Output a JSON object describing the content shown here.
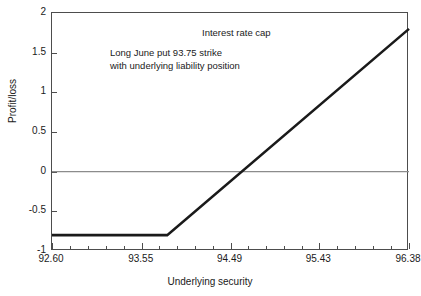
{
  "chart_data": {
    "type": "line",
    "title": "Interest rate cap",
    "annotation_line1": "Long June put 93.75 strike",
    "annotation_line2": "with underlying liability position",
    "xlabel": "Underlying security",
    "ylabel": "Profit/loss",
    "xlim": [
      92.6,
      96.38
    ],
    "ylim": [
      -1,
      2
    ],
    "grid": false,
    "legend": null,
    "xticks": [
      "92.60",
      "93.55",
      "94.49",
      "95.43",
      "96.38"
    ],
    "xtick_values": [
      92.6,
      93.55,
      94.49,
      95.43,
      96.38
    ],
    "xminor_per_interval": 4,
    "yticks": [
      "2",
      "1.5",
      "1",
      "0.5",
      "0",
      "-0.5",
      "-1"
    ],
    "ytick_values": [
      2,
      1.5,
      1,
      0.5,
      0,
      -0.5,
      -1
    ],
    "zero_line": 0,
    "series": [
      {
        "name": "Long June put 93.75 strike with underlying liability position",
        "color": "#1a1a1a",
        "x": [
          92.6,
          93.82,
          96.38
        ],
        "y": [
          -0.8,
          -0.8,
          1.8
        ]
      }
    ],
    "breakeven_x": 94.56,
    "max_loss": -0.8,
    "max_profit_shown": 1.8
  },
  "colors": {
    "line": "#1a1a1a",
    "axis": "#4d4d4d",
    "zero_line": "#8c8c8c",
    "text": "#1a1a1a",
    "background": "#ffffff"
  }
}
